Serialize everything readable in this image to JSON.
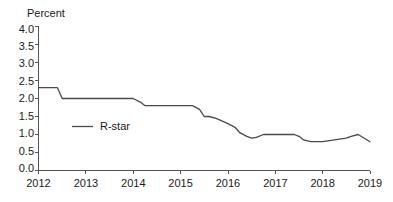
{
  "chart_data": {
    "type": "line",
    "title": "",
    "subtitle": "",
    "xlabel": "",
    "ylabel": "Percent",
    "xlim": [
      2012.0,
      2019.0
    ],
    "ylim": [
      0.0,
      4.0
    ],
    "grid": false,
    "legend_position": "inside-left",
    "y_ticks": [
      "0.0",
      "0.5",
      "1.0",
      "1.5",
      "2.0",
      "2.5",
      "3.0",
      "3.5",
      "4.0"
    ],
    "y_tick_values": [
      0.0,
      0.5,
      1.0,
      1.5,
      2.0,
      2.5,
      3.0,
      3.5,
      4.0
    ],
    "x_ticks": [
      "2012",
      "2013",
      "2014",
      "2015",
      "2016",
      "2017",
      "2018",
      "2019"
    ],
    "x_tick_values": [
      2012,
      2013,
      2014,
      2015,
      2016,
      2017,
      2018,
      2019
    ],
    "series": [
      {
        "name": "R-star",
        "color": "#4a4a4a",
        "x": [
          2012.0,
          2012.25,
          2012.4,
          2012.5,
          2012.75,
          2013.0,
          2013.25,
          2013.5,
          2013.75,
          2014.0,
          2014.15,
          2014.25,
          2014.5,
          2014.75,
          2015.0,
          2015.25,
          2015.4,
          2015.5,
          2015.6,
          2015.75,
          2016.0,
          2016.15,
          2016.25,
          2016.4,
          2016.5,
          2016.6,
          2016.75,
          2017.0,
          2017.25,
          2017.4,
          2017.5,
          2017.6,
          2017.75,
          2018.0,
          2018.25,
          2018.5,
          2018.6,
          2018.75,
          2019.0
        ],
        "values": [
          2.3,
          2.3,
          2.3,
          2.0,
          2.0,
          2.0,
          2.0,
          2.0,
          2.0,
          2.0,
          1.9,
          1.8,
          1.8,
          1.8,
          1.8,
          1.8,
          1.7,
          1.5,
          1.5,
          1.45,
          1.3,
          1.2,
          1.05,
          0.95,
          0.9,
          0.92,
          1.0,
          1.0,
          1.0,
          1.0,
          0.95,
          0.85,
          0.8,
          0.8,
          0.85,
          0.9,
          0.95,
          1.0,
          0.8
        ]
      }
    ]
  },
  "legend": {
    "entries": [
      {
        "label": "R-star"
      }
    ]
  },
  "axis": {
    "y_axis_title": "Percent"
  }
}
